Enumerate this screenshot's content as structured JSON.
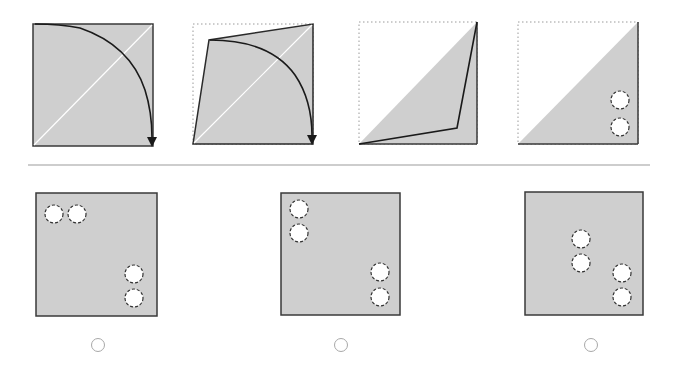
{
  "puzzle": {
    "type": "paper-folding",
    "colors": {
      "paper": "#cfcfcf",
      "outline": "#3a3a3a",
      "dotted": "#9a9a9a",
      "crease": "#ffffff",
      "separator": "#bdbdbd",
      "hole_fill": "#ffffff",
      "radio_border": "#a8a8a8"
    },
    "steps": [
      {
        "id": "step-1",
        "description": "Square sheet with diagonal crease; fold top-left corner along curved arrow to bottom-right"
      },
      {
        "id": "step-2",
        "description": "Top-left corner mid-fold toward bottom-right"
      },
      {
        "id": "step-3",
        "description": "Folded into triangle, flap edge visible"
      },
      {
        "id": "step-4",
        "description": "Triangle with two holes punched near bottom-right",
        "holes": 2
      }
    ],
    "options": [
      {
        "id": "A",
        "label": "A",
        "holes": [
          [
            54,
            214
          ],
          [
            77,
            214
          ],
          [
            134,
            274
          ],
          [
            134,
            298
          ]
        ],
        "selected": false
      },
      {
        "id": "B",
        "label": "B",
        "holes": [
          [
            299,
            209
          ],
          [
            299,
            233
          ],
          [
            380,
            272
          ],
          [
            380,
            297
          ]
        ],
        "selected": false
      },
      {
        "id": "C",
        "label": "C",
        "holes": [
          [
            581,
            239
          ],
          [
            581,
            263
          ],
          [
            622,
            273
          ],
          [
            622,
            297
          ]
        ],
        "selected": false
      }
    ]
  }
}
